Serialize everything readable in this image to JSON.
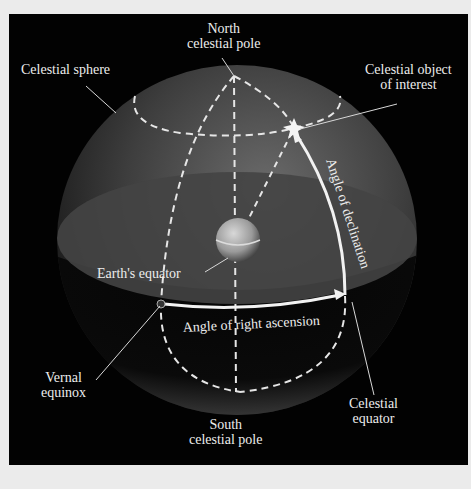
{
  "diagram": {
    "colors": {
      "background": "#020202",
      "page": "#ebebeb",
      "sphere": "#5a5a5a",
      "lines": "#e6e6e6",
      "text": "#ededed"
    },
    "labels": {
      "north_pole_1": "North",
      "north_pole_2": "celestial pole",
      "celestial_sphere": "Celestial sphere",
      "object_1": "Celestial object",
      "object_2": "of interest",
      "declination": "Angle of declination",
      "earth_equator": "Earth's equator",
      "right_ascension": "Angle of right ascension",
      "vernal_1": "Vernal",
      "vernal_2": "equinox",
      "celestial_equator_1": "Celestial",
      "celestial_equator_2": "equator",
      "south_pole_1": "South",
      "south_pole_2": "celestial pole"
    }
  }
}
